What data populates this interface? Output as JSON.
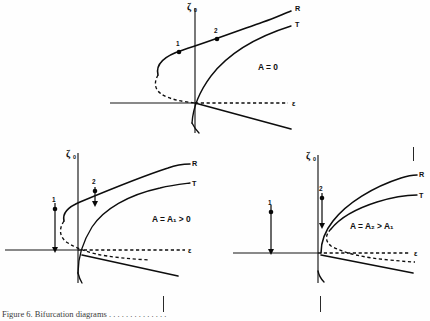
{
  "figure": {
    "kind": "bifurcation-response-curves",
    "panel_count": 3,
    "axis_labels": {
      "vertical": "ζ",
      "vertical_sub": "0",
      "horizontal": "ε"
    },
    "branch_labels": {
      "upper": "R",
      "lower": "T"
    },
    "point_labels": {
      "first": "1",
      "second": "2"
    }
  },
  "panels": [
    {
      "id": "top",
      "name": "panel-a-zero-detuning",
      "parameter_label": "A = 0",
      "parameter_label_parts": {
        "lhs": "A",
        "eq": "=",
        "rhs": "0"
      },
      "vertical_axis": "ζ",
      "vertical_axis_sub": "0",
      "horizontal_axis": "ε",
      "branch_R": "R",
      "branch_T": "T",
      "points": [
        "1",
        "2"
      ],
      "has_arrows": false
    },
    {
      "id": "bottom-left",
      "name": "panel-b-A1",
      "parameter_label": "A = A₁ > 0",
      "parameter_label_parts": {
        "lhs": "A",
        "eq": "=",
        "rhs": "A",
        "rhs_sub": "1",
        "cmp": ">",
        "cmp_rhs": "0"
      },
      "vertical_axis": "ζ",
      "vertical_axis_sub": "0",
      "horizontal_axis": "ε",
      "branch_R": "R",
      "branch_T": "T",
      "points": [
        "1",
        "2"
      ],
      "has_arrows": true
    },
    {
      "id": "bottom-right",
      "name": "panel-c-A2",
      "parameter_label": "A = A₂ > A₁",
      "parameter_label_parts": {
        "lhs": "A",
        "eq": "=",
        "rhs": "A",
        "rhs_sub": "2",
        "cmp": ">",
        "cmp_rhs": "A",
        "cmp_rhs_sub": "1"
      },
      "vertical_axis": "ζ",
      "vertical_axis_sub": "0",
      "horizontal_axis": "ε",
      "branch_R": "R",
      "branch_T": "T",
      "points": [
        "1",
        "2"
      ],
      "has_arrows": true
    }
  ],
  "caption": {
    "text": "Figure 6.   Bifurcation diagrams . . . . . . . . . . . . . .",
    "visible": "partially-cropped"
  },
  "colors": {
    "ink": "#101010",
    "paper": "#fefefe",
    "rule": "#2a2a2a"
  }
}
